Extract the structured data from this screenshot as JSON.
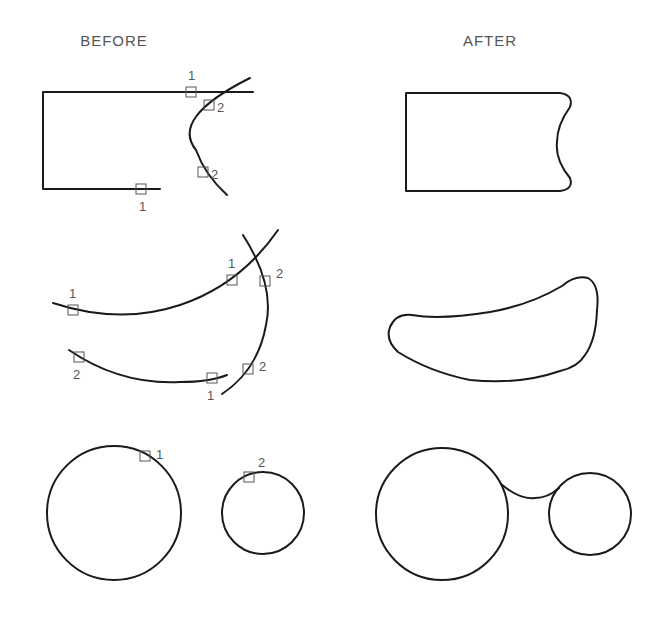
{
  "headings": {
    "before": "BEFORE",
    "after": "AFTER"
  },
  "examples": [
    {
      "name": "line-and-arc-fillet",
      "before_labels": [
        "1",
        "2",
        "2",
        "1"
      ],
      "after_description": "Rectangle with right side filleted to arc"
    },
    {
      "name": "arcs-fillet",
      "before_labels": [
        "1",
        "1",
        "2",
        "2",
        "1",
        "2"
      ],
      "after_description": "Closed curved shape formed by filleted arcs"
    },
    {
      "name": "circles-fillet",
      "before_labels": [
        "1",
        "2"
      ],
      "after_description": "Two circles joined by a fillet arc"
    }
  ],
  "colors": {
    "geometry": "#1a1a1a",
    "markers": "#555555",
    "background": "#ffffff"
  }
}
